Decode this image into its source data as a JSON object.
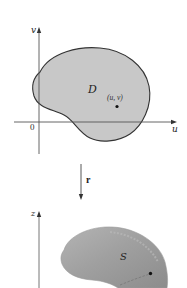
{
  "figure": {
    "top_panel": {
      "axes": {
        "horizontal_label": "u",
        "vertical_label": "v",
        "origin_label": "0"
      },
      "region_label": "D",
      "point_label": "(u, v)",
      "region_fill": "#c8c8c8",
      "outline_color": "#333333"
    },
    "mapping": {
      "label": "r",
      "direction": "down"
    },
    "bottom_panel": {
      "axes": {
        "vertical_label": "z"
      },
      "surface_label": "S",
      "surface_fill": "#9c9c9c",
      "surface_highlight": "#b9b9b9"
    }
  }
}
